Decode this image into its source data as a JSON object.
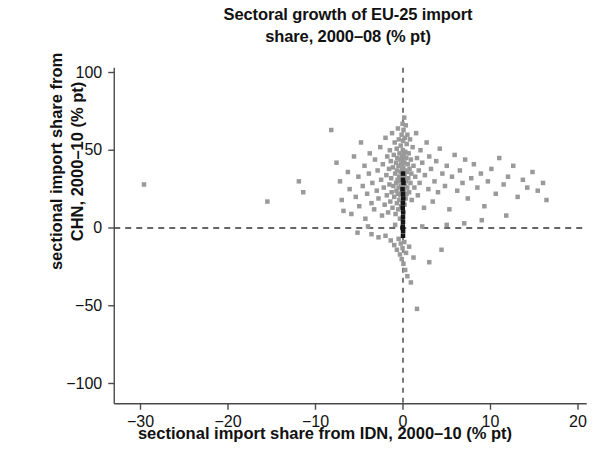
{
  "chart_data": {
    "type": "scatter",
    "title": "Sectoral growth of EU-25 import share, 2000–08 (% pt)",
    "title_line1": "Sectoral growth of EU-25 import",
    "title_line2": "share, 2000–08 (% pt)",
    "xlabel": "sectional import share from IDN, 2000–10 (% pt)",
    "ylabel": "sectional import share from CHN, 2000–10 (% pt)",
    "ylabel_line1": "sectional import share from",
    "ylabel_line2": "CHN, 2000–10 (% pt)",
    "xlim": [
      -33,
      21
    ],
    "ylim": [
      -113,
      103
    ],
    "xticks": [
      -30,
      -20,
      -10,
      0,
      10,
      20
    ],
    "xtick_labels": [
      "−30",
      "−20",
      "−10",
      "0",
      "10",
      "20"
    ],
    "yticks": [
      100,
      50,
      0,
      -50,
      -100
    ],
    "ytick_labels": [
      "100",
      "50",
      "0",
      "−50",
      "−100"
    ],
    "grid": false,
    "legend": null,
    "reference_lines": [
      {
        "axis": "y",
        "value": 0,
        "style": "dashed",
        "color": "#333333"
      },
      {
        "axis": "x",
        "value": 0,
        "style": "dashed",
        "color": "#333333"
      }
    ],
    "marker": {
      "shape": "square",
      "size_px": 4.5,
      "color": "#9a9a9a",
      "highlight_color": "#151515"
    },
    "series": [
      {
        "name": "sectors (gray)",
        "color": "#9a9a9a",
        "points": [
          [
            -29.6,
            28
          ],
          [
            -15.5,
            17
          ],
          [
            -11.9,
            30
          ],
          [
            -11.4,
            23
          ],
          [
            -8.2,
            63
          ],
          [
            -7.6,
            42
          ],
          [
            -7.2,
            30
          ],
          [
            -7.0,
            18
          ],
          [
            -6.8,
            11
          ],
          [
            -6.3,
            36
          ],
          [
            -6.1,
            25
          ],
          [
            -5.9,
            9
          ],
          [
            -5.6,
            46
          ],
          [
            -5.4,
            20
          ],
          [
            -5.1,
            33
          ],
          [
            -5.0,
            14
          ],
          [
            -4.8,
            55
          ],
          [
            -4.6,
            27
          ],
          [
            -4.4,
            40
          ],
          [
            -4.3,
            6
          ],
          [
            -4.1,
            22
          ],
          [
            -3.9,
            35
          ],
          [
            -3.8,
            48
          ],
          [
            -3.6,
            16
          ],
          [
            -3.5,
            29
          ],
          [
            -3.3,
            12
          ],
          [
            -3.2,
            44
          ],
          [
            -3.0,
            24
          ],
          [
            -2.9,
            37
          ],
          [
            -2.8,
            19
          ],
          [
            -2.6,
            52
          ],
          [
            -2.5,
            31
          ],
          [
            -2.4,
            8
          ],
          [
            -2.3,
            41
          ],
          [
            -2.2,
            26
          ],
          [
            -2.1,
            15
          ],
          [
            -2.0,
            58
          ],
          [
            -1.9,
            34
          ],
          [
            -1.85,
            21
          ],
          [
            -1.8,
            46
          ],
          [
            -1.7,
            10
          ],
          [
            -1.6,
            38
          ],
          [
            -1.55,
            28
          ],
          [
            -1.5,
            50
          ],
          [
            -1.45,
            17
          ],
          [
            -1.4,
            43
          ],
          [
            -1.35,
            32
          ],
          [
            -1.3,
            23
          ],
          [
            -1.25,
            61
          ],
          [
            -1.2,
            13
          ],
          [
            -1.15,
            39
          ],
          [
            -1.1,
            27
          ],
          [
            -1.05,
            47
          ],
          [
            -1.0,
            20
          ],
          [
            -0.95,
            55
          ],
          [
            -0.9,
            35
          ],
          [
            -0.85,
            9
          ],
          [
            -0.8,
            42
          ],
          [
            -0.78,
            29
          ],
          [
            -0.75,
            24
          ],
          [
            -0.72,
            51
          ],
          [
            -0.7,
            16
          ],
          [
            -0.68,
            37
          ],
          [
            -0.65,
            45
          ],
          [
            -0.62,
            31
          ],
          [
            -0.6,
            22
          ],
          [
            -0.58,
            64
          ],
          [
            -0.55,
            12
          ],
          [
            -0.52,
            40
          ],
          [
            -0.5,
            26
          ],
          [
            -0.48,
            57
          ],
          [
            -0.45,
            33
          ],
          [
            -0.42,
            18
          ],
          [
            -0.4,
            48
          ],
          [
            -0.38,
            30
          ],
          [
            -0.35,
            6
          ],
          [
            -0.33,
            44
          ],
          [
            -0.3,
            21
          ],
          [
            -0.28,
            36
          ],
          [
            -0.26,
            53
          ],
          [
            -0.24,
            27
          ],
          [
            -0.22,
            14
          ],
          [
            -0.2,
            41
          ],
          [
            -0.18,
            32
          ],
          [
            -0.16,
            60
          ],
          [
            -0.14,
            23
          ],
          [
            -0.12,
            38
          ],
          [
            -0.1,
            46
          ],
          [
            -0.08,
            29
          ],
          [
            -0.06,
            17
          ],
          [
            -0.05,
            67
          ],
          [
            -0.04,
            34
          ],
          [
            -0.03,
            25
          ],
          [
            -0.02,
            50
          ],
          [
            -0.01,
            11
          ],
          [
            0.0,
            43
          ],
          [
            0.01,
            31
          ],
          [
            0.02,
            56
          ],
          [
            0.03,
            20
          ],
          [
            0.04,
            39
          ],
          [
            0.05,
            28
          ],
          [
            0.06,
            63
          ],
          [
            0.08,
            35
          ],
          [
            0.1,
            47
          ],
          [
            0.12,
            24
          ],
          [
            0.14,
            71
          ],
          [
            0.16,
            42
          ],
          [
            0.18,
            15
          ],
          [
            0.2,
            33
          ],
          [
            0.22,
            58
          ],
          [
            0.24,
            27
          ],
          [
            0.26,
            49
          ],
          [
            0.28,
            37
          ],
          [
            0.3,
            19
          ],
          [
            0.32,
            66
          ],
          [
            0.35,
            30
          ],
          [
            0.38,
            45
          ],
          [
            0.4,
            22
          ],
          [
            0.42,
            54
          ],
          [
            0.45,
            36
          ],
          [
            0.48,
            26
          ],
          [
            0.5,
            60
          ],
          [
            0.55,
            41
          ],
          [
            0.6,
            32
          ],
          [
            0.65,
            48
          ],
          [
            0.7,
            23
          ],
          [
            0.75,
            38
          ],
          [
            0.8,
            57
          ],
          [
            0.85,
            29
          ],
          [
            0.9,
            44
          ],
          [
            0.95,
            35
          ],
          [
            1.0,
            18
          ],
          [
            1.1,
            52
          ],
          [
            1.2,
            40
          ],
          [
            1.3,
            26
          ],
          [
            1.4,
            33
          ],
          [
            1.5,
            61
          ],
          [
            1.6,
            45
          ],
          [
            1.7,
            21
          ],
          [
            1.8,
            37
          ],
          [
            1.9,
            29
          ],
          [
            2.0,
            50
          ],
          [
            2.2,
            42
          ],
          [
            2.4,
            13
          ],
          [
            2.5,
            34
          ],
          [
            2.7,
            55
          ],
          [
            2.9,
            25
          ],
          [
            3.0,
            46
          ],
          [
            3.2,
            38
          ],
          [
            3.4,
            17
          ],
          [
            3.6,
            30
          ],
          [
            3.8,
            43
          ],
          [
            4.0,
            23
          ],
          [
            4.2,
            51
          ],
          [
            4.5,
            35
          ],
          [
            4.8,
            27
          ],
          [
            5.0,
            40
          ],
          [
            5.3,
            12
          ],
          [
            5.6,
            33
          ],
          [
            5.9,
            47
          ],
          [
            6.2,
            24
          ],
          [
            6.5,
            37
          ],
          [
            6.8,
            29
          ],
          [
            7.1,
            44
          ],
          [
            7.4,
            19
          ],
          [
            7.8,
            32
          ],
          [
            8.1,
            41
          ],
          [
            8.5,
            26
          ],
          [
            8.9,
            35
          ],
          [
            9.3,
            14
          ],
          [
            9.7,
            30
          ],
          [
            10.1,
            38
          ],
          [
            10.6,
            22
          ],
          [
            11.0,
            45
          ],
          [
            11.5,
            28
          ],
          [
            12.0,
            33
          ],
          [
            12.6,
            40
          ],
          [
            13.1,
            20
          ],
          [
            13.7,
            31
          ],
          [
            14.2,
            26
          ],
          [
            14.8,
            36
          ],
          [
            15.4,
            24
          ],
          [
            16.0,
            29
          ],
          [
            16.4,
            18
          ],
          [
            -5.2,
            -3
          ],
          [
            -3.6,
            -4
          ],
          [
            -2.8,
            -6
          ],
          [
            -2.0,
            -5
          ],
          [
            -1.4,
            -8
          ],
          [
            -1.0,
            -11
          ],
          [
            -0.7,
            -14
          ],
          [
            -0.5,
            -7
          ],
          [
            -0.35,
            -17
          ],
          [
            -0.25,
            -10
          ],
          [
            -0.15,
            -20
          ],
          [
            -0.05,
            -13
          ],
          [
            0.05,
            -23
          ],
          [
            0.15,
            -9
          ],
          [
            0.25,
            -27
          ],
          [
            0.35,
            -16
          ],
          [
            0.5,
            -31
          ],
          [
            0.7,
            -12
          ],
          [
            0.9,
            -35
          ],
          [
            1.2,
            -19
          ],
          [
            3.0,
            -22
          ],
          [
            4.4,
            -14
          ],
          [
            1.6,
            -52
          ],
          [
            7.0,
            3
          ],
          [
            9.0,
            5
          ],
          [
            11.8,
            8
          ],
          [
            5.0,
            2
          ],
          [
            2.2,
            1
          ],
          [
            -0.9,
            2
          ],
          [
            -4.0,
            1
          ]
        ]
      },
      {
        "name": "sectors (dark, near zero)",
        "color": "#151515",
        "points": [
          [
            0.0,
            31
          ],
          [
            0.05,
            29
          ],
          [
            -0.05,
            25
          ],
          [
            0.0,
            22
          ],
          [
            0.03,
            19
          ],
          [
            0.0,
            16
          ],
          [
            -0.03,
            13
          ],
          [
            0.02,
            10
          ],
          [
            0.0,
            7
          ],
          [
            0.0,
            4
          ],
          [
            -0.02,
            1
          ],
          [
            0.01,
            -2
          ],
          [
            0.0,
            -5
          ],
          [
            0.0,
            35
          ],
          [
            -0.04,
            0
          ]
        ]
      }
    ]
  },
  "axes": {
    "x_axis_name": "x-axis",
    "y_axis_name": "y-axis"
  }
}
